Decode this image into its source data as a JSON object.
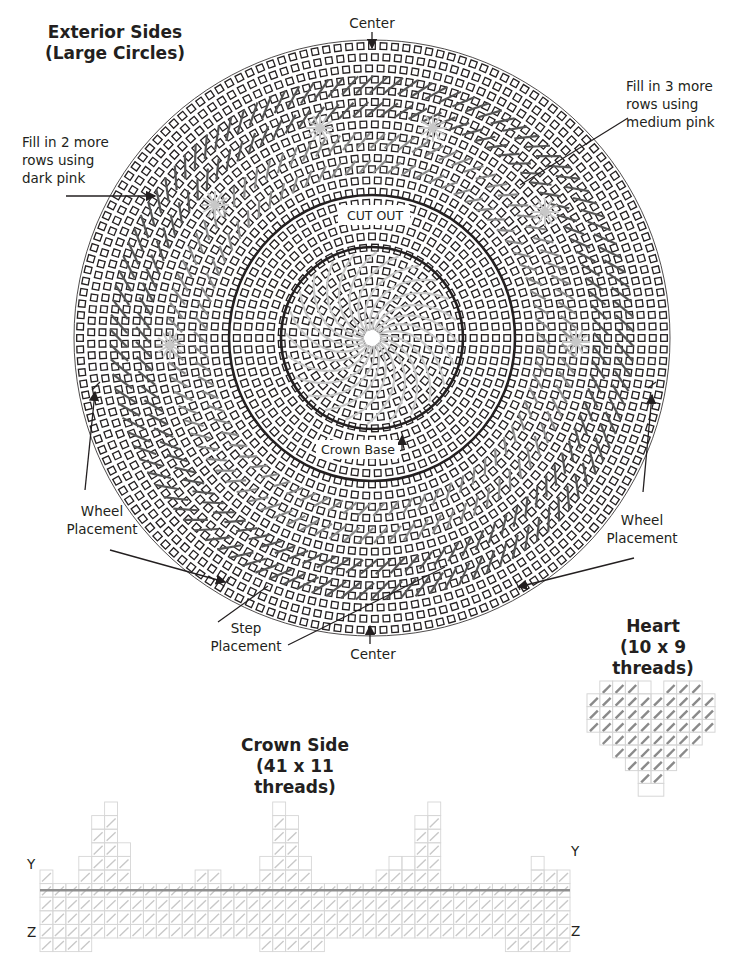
{
  "diagram": {
    "circle_section": {
      "title_line1": "Exterior Sides",
      "title_line2": "(Large Circles)",
      "center_top_label": "Center",
      "center_bottom_label": "Center",
      "cut_out_label": "CUT OUT",
      "crown_base_label": "Crown Base",
      "fill_dark_pink": [
        "Fill in 2 more",
        "rows using",
        "dark pink"
      ],
      "fill_medium_pink": [
        "Fill in 3 more",
        "rows using",
        "medium pink"
      ],
      "wheel_placement_left": [
        "Wheel",
        "Placement"
      ],
      "wheel_placement_right": [
        "Wheel",
        "Placement"
      ],
      "step_placement": [
        "Step",
        "Placement"
      ]
    },
    "heart_section": {
      "title_line1": "Heart",
      "title_line2": "(10 x 9 threads)",
      "columns": 10,
      "rows": 9
    },
    "crown_section": {
      "title_line1": "Crown Side",
      "title_line2": "(41 x 11 threads)",
      "columns": 41,
      "rows": 11,
      "left_top_marker": "Y",
      "left_bottom_marker": "Z",
      "right_top_marker": "Y",
      "right_bottom_marker": "Z"
    },
    "colors": {
      "ink": "#231f20",
      "stitch_dark": "#555555",
      "stitch_medium": "#8a8a8a",
      "stitch_light": "#c8c8c8",
      "grid_line": "#d6d6d6",
      "crown_midline": "#8f8f8f"
    }
  }
}
